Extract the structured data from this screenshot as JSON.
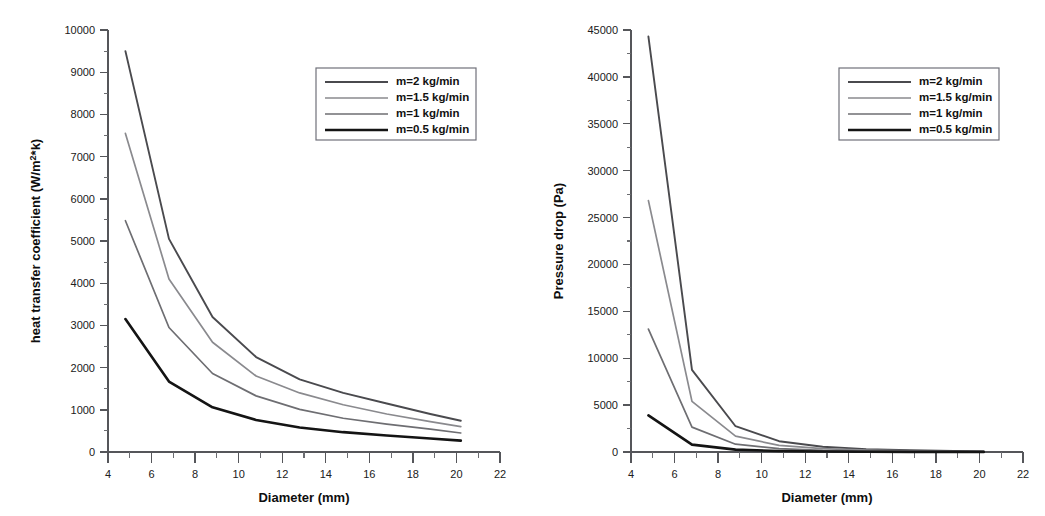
{
  "figure": {
    "background": "#ffffff",
    "width": 1045,
    "height": 516,
    "panel_count": 2
  },
  "style": {
    "series_colors": [
      "#4a4a4e",
      "#8a8a8e",
      "#6e6e72",
      "#141414"
    ],
    "series_widths": [
      1.9,
      1.7,
      1.7,
      2.6
    ],
    "axis_color": "#55565a",
    "text_color": "#111111"
  },
  "legend": {
    "labels": [
      "m=2 kg/min",
      "m=1.5 kg/min",
      "m=1 kg/min",
      "m=0.5 kg/min"
    ],
    "border_color": "#70717a",
    "position": "upper-right"
  },
  "chart_data": [
    {
      "id": "heat-transfer-coefficient",
      "type": "line",
      "title": "",
      "xlabel": "Diameter (mm)",
      "ylabel": "heat transfer coefficient (W/m2*k)",
      "ylabel_base": "heat transfer coefficient (W/m",
      "ylabel_sup": "2",
      "ylabel_tail": "*k)",
      "xlim": [
        4,
        22
      ],
      "ylim": [
        0,
        10000
      ],
      "xticks": [
        4,
        6,
        8,
        10,
        12,
        14,
        16,
        18,
        20,
        22
      ],
      "xticklabels": [
        "4",
        "6",
        "8",
        "10",
        "12",
        "14",
        "16",
        "18",
        "20",
        "22"
      ],
      "xminor_step": 1,
      "yticks": [
        0,
        1000,
        2000,
        3000,
        4000,
        5000,
        6000,
        7000,
        8000,
        9000,
        10000
      ],
      "yticklabels": [
        "0",
        "1000",
        "2000",
        "3000",
        "4000",
        "5000",
        "6000",
        "7000",
        "8000",
        "9000",
        "10000"
      ],
      "yminor_step": 500,
      "grid": false,
      "legend_position": "upper-right",
      "x": [
        4.8,
        6.8,
        8.8,
        10.8,
        12.8,
        14.8,
        16.8,
        18.8,
        20.2
      ],
      "series": [
        {
          "name": "m=2 kg/min",
          "color": "#4a4a4e",
          "width": 1.9,
          "values": [
            9500,
            5050,
            3200,
            2250,
            1720,
            1400,
            1150,
            900,
            740
          ]
        },
        {
          "name": "m=1.5 kg/min",
          "color": "#8a8a8e",
          "width": 1.7,
          "values": [
            7550,
            4100,
            2600,
            1800,
            1400,
            1120,
            900,
            720,
            600
          ]
        },
        {
          "name": "m=1 kg/min",
          "color": "#6e6e72",
          "width": 1.7,
          "values": [
            5480,
            2950,
            1860,
            1330,
            1010,
            800,
            660,
            540,
            450
          ]
        },
        {
          "name": "m=0.5 kg/min",
          "color": "#141414",
          "width": 2.6,
          "values": [
            3150,
            1670,
            1060,
            760,
            580,
            470,
            390,
            320,
            270
          ]
        }
      ]
    },
    {
      "id": "pressure-drop",
      "type": "line",
      "title": "",
      "xlabel": "Diameter (mm)",
      "ylabel": "Pressure drop (Pa)",
      "xlim": [
        4,
        22
      ],
      "ylim": [
        0,
        45000
      ],
      "xticks": [
        4,
        6,
        8,
        10,
        12,
        14,
        16,
        18,
        20,
        22
      ],
      "xticklabels": [
        "4",
        "6",
        "8",
        "10",
        "12",
        "14",
        "16",
        "18",
        "20",
        "22"
      ],
      "xminor_step": 1,
      "yticks": [
        0,
        5000,
        10000,
        15000,
        20000,
        25000,
        30000,
        35000,
        40000,
        45000
      ],
      "yticklabels": [
        "0",
        "5000",
        "10000",
        "15000",
        "20000",
        "25000",
        "30000",
        "35000",
        "40000",
        "45000"
      ],
      "yminor_step": 2500,
      "grid": false,
      "legend_position": "upper-right",
      "x": [
        4.8,
        6.8,
        8.8,
        10.8,
        12.8,
        14.8,
        16.8,
        18.8,
        20.2
      ],
      "series": [
        {
          "name": "m=2 kg/min",
          "color": "#4a4a4e",
          "width": 1.9,
          "values": [
            44300,
            8750,
            2750,
            1150,
            560,
            310,
            180,
            110,
            80
          ]
        },
        {
          "name": "m=1.5 kg/min",
          "color": "#8a8a8e",
          "width": 1.7,
          "values": [
            26800,
            5400,
            1700,
            700,
            350,
            190,
            110,
            70,
            50
          ]
        },
        {
          "name": "m=1 kg/min",
          "color": "#6e6e72",
          "width": 1.7,
          "values": [
            13100,
            2650,
            830,
            350,
            170,
            95,
            55,
            35,
            25
          ]
        },
        {
          "name": "m=0.5 kg/min",
          "color": "#141414",
          "width": 2.6,
          "values": [
            3900,
            790,
            250,
            105,
            50,
            28,
            16,
            10,
            7
          ]
        }
      ]
    }
  ]
}
